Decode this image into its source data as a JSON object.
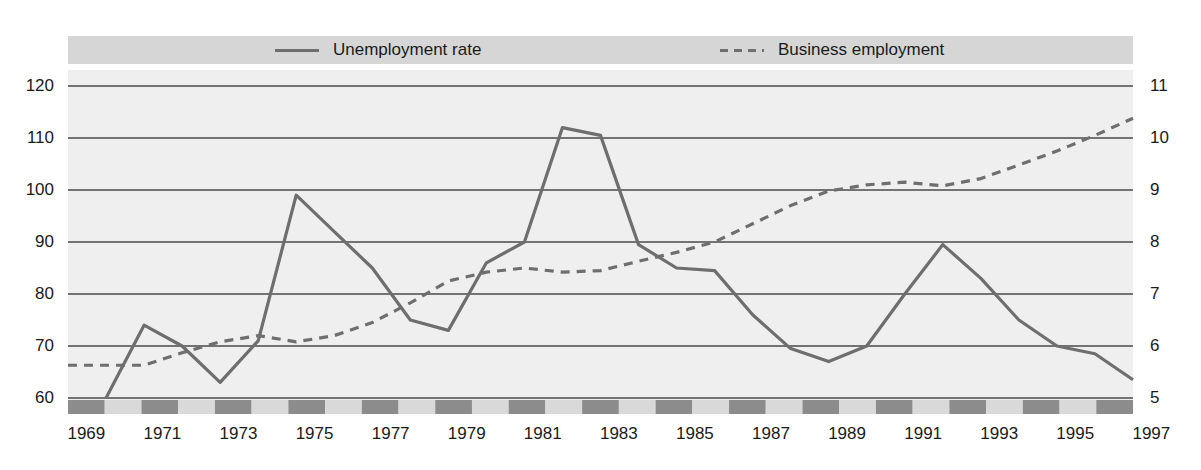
{
  "legend": {
    "entries": [
      {
        "label": "Unemployment rate",
        "style": "solid",
        "color": "#6e6e6e"
      },
      {
        "label": "Business employment",
        "style": "dashed",
        "color": "#6e6e6e"
      }
    ]
  },
  "colors": {
    "line": "#6e6e6e",
    "gridline": "#4a4a4a",
    "plot_background": "#efefef",
    "legend_background": "#d6d6d6",
    "band_dark": "#8c8c8c",
    "band_light": "#d9d9d9",
    "text": "#1a1a1a"
  },
  "chart_data": {
    "type": "line",
    "title": "",
    "xlabel": "",
    "grid": true,
    "legend_position": "top",
    "x": [
      1969,
      1970,
      1971,
      1972,
      1973,
      1974,
      1975,
      1976,
      1977,
      1978,
      1979,
      1980,
      1981,
      1982,
      1983,
      1984,
      1985,
      1986,
      1987,
      1988,
      1989,
      1990,
      1991,
      1992,
      1993,
      1994,
      1995,
      1996,
      1997
    ],
    "xticks": [
      1969,
      1971,
      1973,
      1975,
      1977,
      1979,
      1981,
      1983,
      1985,
      1987,
      1989,
      1991,
      1993,
      1995,
      1997
    ],
    "axes": {
      "left": {
        "label": "Unemployment rate",
        "ticks": [
          60,
          70,
          80,
          90,
          100,
          110,
          120
        ],
        "ylim": [
          60,
          120
        ]
      },
      "right": {
        "label": "Business employment",
        "ticks": [
          5,
          6,
          7,
          8,
          9,
          10,
          11
        ],
        "ylim": [
          5,
          11
        ]
      }
    },
    "series": [
      {
        "name": "Unemployment rate",
        "axis": "left",
        "style": "solid",
        "x": [
          1970,
          1971,
          1972,
          1973,
          1974,
          1975,
          1976,
          1977,
          1978,
          1979,
          1980,
          1981,
          1982,
          1983,
          1984,
          1985,
          1986,
          1987,
          1988,
          1989,
          1990,
          1991,
          1992,
          1993,
          1994,
          1995,
          1996,
          1997
        ],
        "values": [
          60,
          74,
          70,
          63,
          71,
          99,
          92,
          85,
          75,
          73,
          86,
          90,
          112,
          110.5,
          89.5,
          85,
          84.5,
          76,
          69.5,
          67,
          70,
          80,
          89.5,
          83,
          75,
          70,
          68.5,
          63.5
        ]
      },
      {
        "name": "Business employment",
        "axis": "right",
        "style": "dashed",
        "x": [
          1969,
          1970,
          1971,
          1972,
          1973,
          1974,
          1975,
          1976,
          1977,
          1978,
          1979,
          1980,
          1981,
          1982,
          1983,
          1984,
          1985,
          1986,
          1987,
          1988,
          1989,
          1990,
          1991,
          1992,
          1993,
          1994,
          1995,
          1996,
          1997
        ],
        "values": [
          5.63,
          5.63,
          5.63,
          5.87,
          6.08,
          6.2,
          6.08,
          6.2,
          6.45,
          6.83,
          7.25,
          7.42,
          7.5,
          7.42,
          7.45,
          7.63,
          7.8,
          8.0,
          8.35,
          8.7,
          8.98,
          9.1,
          9.15,
          9.08,
          9.22,
          9.48,
          9.75,
          10.05,
          10.38
        ]
      }
    ]
  }
}
